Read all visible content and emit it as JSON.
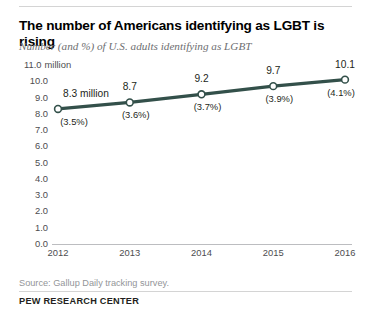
{
  "header": {
    "title": "The number of Americans identifying as LGBT is rising",
    "subtitle": "Number (and %) of U.S. adults identifying as LGBT"
  },
  "footer": {
    "source": "Source: Gallup Daily tracking survey.",
    "brand": "PEW RESEARCH CENTER"
  },
  "colors": {
    "line": "#33504a",
    "marker_fill": "#ffffff",
    "axis": "#bcbdc0",
    "rule": "#d4d4d4",
    "text": "#231f20",
    "muted_text": "#6d6e71",
    "source_text": "#939598"
  },
  "chart_data": {
    "type": "line",
    "title": "The number of Americans identifying as LGBT is rising",
    "subtitle": "Number (and %) of U.S. adults identifying as LGBT",
    "xlabel": "",
    "ylabel": "",
    "x": [
      2012,
      2013,
      2014,
      2015,
      2016
    ],
    "categories": [
      "2012",
      "2013",
      "2014",
      "2015",
      "2016"
    ],
    "values": [
      8.3,
      8.7,
      9.2,
      9.7,
      10.1
    ],
    "point_labels": [
      "8.3 million",
      "8.7",
      "9.2",
      "9.7",
      "10.1"
    ],
    "percent_labels": [
      "(3.5%)",
      "(3.6%)",
      "(3.7%)",
      "(3.9%)",
      "(4.1%)"
    ],
    "percents": [
      3.5,
      3.6,
      3.7,
      3.9,
      4.1
    ],
    "ylim": [
      0.0,
      11.0
    ],
    "ytick_values": [
      11.0,
      10.0,
      9.0,
      8.0,
      7.0,
      6.0,
      5.0,
      4.0,
      3.0,
      2.0,
      1.0,
      0.0
    ],
    "ytick_labels": [
      "11.0",
      "10.0",
      "9.0",
      "8.0",
      "7.0",
      "6.0",
      "5.0",
      "4.0",
      "3.0",
      "2.0",
      "1.0",
      "0.0"
    ],
    "ytick_unit_suffix": "million",
    "grid": false,
    "legend": false,
    "marker": "open-circle",
    "series": [
      {
        "name": "Adults identifying as LGBT (millions)",
        "values": [
          8.3,
          8.7,
          9.2,
          9.7,
          10.1
        ]
      }
    ]
  }
}
